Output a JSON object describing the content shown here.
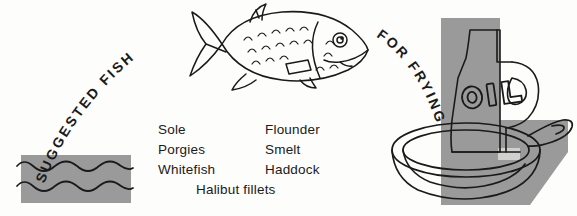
{
  "poster": {
    "headline_left": "SUGGESTED FISH",
    "headline_right": "FOR FRYING",
    "bottle_label": "OIL"
  },
  "fish_list": {
    "left_column": [
      "Sole",
      "Porgies",
      "Whitefish"
    ],
    "right_column": [
      "Flounder",
      "Smelt",
      "Haddock"
    ],
    "footer": "Halibut fillets"
  },
  "colors": {
    "ink": "#1a1a1a",
    "gray_block": "#9a9a9a",
    "gray_block_dark": "#8e8e8e",
    "paper": "#fdfdfc"
  },
  "illustrations": {
    "fish": "fish-illustration",
    "water": "water-block-illustration",
    "oil_bottle": "oil-bottle-illustration",
    "frying_pan": "frying-pan-illustration"
  }
}
